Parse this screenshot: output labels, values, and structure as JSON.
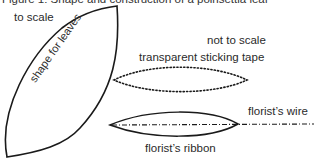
{
  "figure": {
    "caption": "Figure 1: Shape and construction of a poinsettia leaf"
  },
  "labels": {
    "to_scale": "to scale",
    "shape_for_leaves": "shape for leaves",
    "not_to_scale": "not to scale",
    "transparent_tape": "transparent sticking tape",
    "florists_wire": "florist’s wire",
    "florists_ribbon": "florist’s ribbon"
  },
  "colors": {
    "stroke": "#1a1a1a",
    "text": "#2a2a2a"
  }
}
